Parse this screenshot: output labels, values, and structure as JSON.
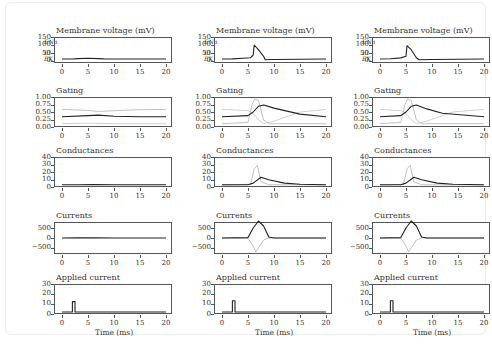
{
  "figure": {
    "columns": 3,
    "row_titles": [
      "Membrane voltage (mV)",
      "Gating",
      "Conductances",
      "Currents",
      "Applied current"
    ],
    "x_axis_title": "Time (ms)",
    "x_ticks": [
      "0",
      "5",
      "10",
      "15",
      "20"
    ],
    "y_ticks": {
      "voltage": [
        "150",
        "100",
        "50",
        "0"
      ],
      "voltage_markers": [
        "E_Na",
        "E_l",
        "E_K"
      ],
      "gating": [
        "1.00",
        "0.75",
        "0.50",
        "0.25",
        "0.00"
      ],
      "conductances": [
        "40",
        "30",
        "20",
        "10",
        "0"
      ],
      "currents": [
        "500",
        "0",
        "−500"
      ],
      "applied": [
        "30",
        "20",
        "10",
        "0"
      ]
    }
  },
  "chart_data": [
    {
      "type": "line",
      "panel": "column-1 (subthreshold)",
      "xlabel": "Time (ms)",
      "xlim": [
        0,
        20
      ],
      "subplots": [
        {
          "title": "Membrane voltage (mV)",
          "ylim": [
            -15,
            150
          ],
          "series": [
            {
              "name": "V",
              "x": [
                0,
                2,
                3,
                5,
                7,
                8,
                10,
                15,
                20
              ],
              "y": [
                0,
                0,
                3,
                5,
                3,
                1,
                0,
                0,
                0
              ]
            }
          ]
        },
        {
          "title": "Gating",
          "ylim": [
            0,
            1
          ],
          "series": [
            {
              "name": "n",
              "x": [
                0,
                5,
                7,
                10,
                15,
                20
              ],
              "y": [
                0.32,
                0.36,
                0.38,
                0.34,
                0.32,
                0.32
              ]
            },
            {
              "name": "h",
              "x": [
                0,
                5,
                7,
                10,
                15,
                20
              ],
              "y": [
                0.6,
                0.56,
                0.52,
                0.55,
                0.59,
                0.6
              ]
            },
            {
              "name": "m",
              "x": [
                0,
                5,
                7,
                10,
                15,
                20
              ],
              "y": [
                0.05,
                0.07,
                0.06,
                0.05,
                0.05,
                0.05
              ]
            }
          ]
        },
        {
          "title": "Conductances",
          "ylim": [
            0,
            40
          ],
          "series": [
            {
              "name": "gK",
              "x": [
                0,
                3,
                6,
                10,
                20
              ],
              "y": [
                0.3,
                0.5,
                0.6,
                0.4,
                0.3
              ]
            }
          ]
        },
        {
          "title": "Currents",
          "ylim": [
            -700,
            700
          ],
          "series": [
            {
              "name": "I",
              "x": [
                0,
                3,
                6,
                10,
                20
              ],
              "y": [
                0,
                5,
                5,
                0,
                0
              ]
            }
          ]
        },
        {
          "title": "Applied current",
          "ylim": [
            0,
            30
          ],
          "series": [
            {
              "name": "I_app",
              "x": [
                0,
                2,
                2,
                2.5,
                2.5,
                20
              ],
              "y": [
                0,
                0,
                12,
                12,
                0,
                0
              ]
            }
          ]
        }
      ]
    },
    {
      "type": "line",
      "panel": "column-2 (action potential)",
      "xlabel": "Time (ms)",
      "xlim": [
        0,
        20
      ],
      "subplots": [
        {
          "title": "Membrane voltage (mV)",
          "ylim": [
            -15,
            150
          ],
          "series": [
            {
              "name": "V",
              "x": [
                0,
                2,
                4,
                5.5,
                6,
                6.2,
                7,
                8,
                8.3,
                10,
                15,
                20
              ],
              "y": [
                0,
                1,
                5,
                10,
                30,
                105,
                70,
                20,
                -5,
                -4,
                -2,
                0
              ]
            }
          ]
        },
        {
          "title": "Gating",
          "ylim": [
            0,
            1
          ],
          "series": [
            {
              "name": "n",
              "x": [
                0,
                5,
                6,
                7,
                8,
                10,
                15,
                20
              ],
              "y": [
                0.32,
                0.36,
                0.5,
                0.72,
                0.77,
                0.65,
                0.42,
                0.32
              ]
            },
            {
              "name": "m",
              "x": [
                0,
                5,
                5.8,
                6.3,
                7,
                8,
                9,
                20
              ],
              "y": [
                0.05,
                0.1,
                0.8,
                1.0,
                0.95,
                0.2,
                0.05,
                0.05
              ]
            },
            {
              "name": "h",
              "x": [
                0,
                5,
                6,
                7,
                8,
                10,
                15,
                20
              ],
              "y": [
                0.6,
                0.55,
                0.45,
                0.2,
                0.05,
                0.15,
                0.5,
                0.6
              ]
            }
          ]
        },
        {
          "title": "Conductances",
          "ylim": [
            0,
            40
          ],
          "series": [
            {
              "name": "gK",
              "x": [
                0,
                5,
                6,
                7.5,
                9,
                12,
                15,
                20
              ],
              "y": [
                0.3,
                0.5,
                3,
                12,
                8,
                3,
                1,
                0.3
              ]
            },
            {
              "name": "gNa",
              "x": [
                0,
                5.5,
                6.2,
                6.8,
                7.5,
                9,
                20
              ],
              "y": [
                0,
                1,
                25,
                30,
                5,
                0.5,
                0
              ]
            }
          ]
        },
        {
          "title": "Currents",
          "ylim": [
            -700,
            700
          ],
          "series": [
            {
              "name": "IK",
              "x": [
                0,
                5,
                6,
                7,
                8,
                9,
                10,
                20
              ],
              "y": [
                0,
                20,
                500,
                850,
                600,
                50,
                0,
                0
              ]
            },
            {
              "name": "INa",
              "x": [
                0,
                5,
                6,
                6.5,
                7,
                8,
                9,
                20
              ],
              "y": [
                0,
                -10,
                -400,
                -700,
                -500,
                -100,
                0,
                0
              ]
            }
          ]
        },
        {
          "title": "Applied current",
          "ylim": [
            0,
            30
          ],
          "series": [
            {
              "name": "I_app",
              "x": [
                0,
                2,
                2,
                2.5,
                2.5,
                20
              ],
              "y": [
                0,
                0,
                13,
                13,
                0,
                0
              ]
            }
          ]
        }
      ]
    },
    {
      "type": "line",
      "panel": "column-3 (action potential, earlier)",
      "xlabel": "Time (ms)",
      "xlim": [
        0,
        20
      ],
      "subplots": [
        {
          "title": "Membrane voltage (mV)",
          "ylim": [
            -15,
            150
          ],
          "series": [
            {
              "name": "V",
              "x": [
                0,
                2,
                4,
                5,
                5.2,
                6,
                7,
                7.5,
                10,
                15,
                20
              ],
              "y": [
                0,
                2,
                8,
                20,
                100,
                70,
                10,
                -5,
                -4,
                -2,
                0
              ]
            }
          ]
        },
        {
          "title": "Gating",
          "ylim": [
            0,
            1
          ],
          "series": [
            {
              "name": "n",
              "x": [
                0,
                4,
                5,
                6,
                7,
                9,
                12,
                20
              ],
              "y": [
                0.32,
                0.36,
                0.5,
                0.72,
                0.77,
                0.62,
                0.45,
                0.32
              ]
            },
            {
              "name": "m",
              "x": [
                0,
                4,
                4.8,
                5.3,
                6,
                7,
                8,
                20
              ],
              "y": [
                0.05,
                0.1,
                0.8,
                1.0,
                0.95,
                0.2,
                0.05,
                0.05
              ]
            },
            {
              "name": "h",
              "x": [
                0,
                4,
                5,
                6,
                7,
                9,
                14,
                20
              ],
              "y": [
                0.6,
                0.55,
                0.45,
                0.2,
                0.05,
                0.15,
                0.5,
                0.6
              ]
            }
          ]
        },
        {
          "title": "Conductances",
          "ylim": [
            0,
            40
          ],
          "series": [
            {
              "name": "gK",
              "x": [
                0,
                4,
                5,
                6.5,
                8,
                11,
                14,
                20
              ],
              "y": [
                0.3,
                0.5,
                3,
                12,
                8,
                3,
                1,
                0.3
              ]
            },
            {
              "name": "gNa",
              "x": [
                0,
                4.5,
                5.2,
                5.8,
                6.5,
                8,
                20
              ],
              "y": [
                0,
                1,
                25,
                30,
                5,
                0.5,
                0
              ]
            }
          ]
        },
        {
          "title": "Currents",
          "ylim": [
            -700,
            700
          ],
          "series": [
            {
              "name": "IK",
              "x": [
                0,
                4,
                5,
                6,
                7,
                8,
                9,
                20
              ],
              "y": [
                0,
                20,
                500,
                850,
                600,
                50,
                0,
                0
              ]
            },
            {
              "name": "INa",
              "x": [
                0,
                4,
                5,
                5.5,
                6,
                7,
                8,
                20
              ],
              "y": [
                0,
                -10,
                -400,
                -700,
                -500,
                -100,
                0,
                0
              ]
            }
          ]
        },
        {
          "title": "Applied current",
          "ylim": [
            0,
            30
          ],
          "series": [
            {
              "name": "I_app",
              "x": [
                0,
                2,
                2,
                2.5,
                2.5,
                20
              ],
              "y": [
                0,
                0,
                13,
                13,
                0,
                0
              ]
            }
          ]
        }
      ]
    }
  ]
}
